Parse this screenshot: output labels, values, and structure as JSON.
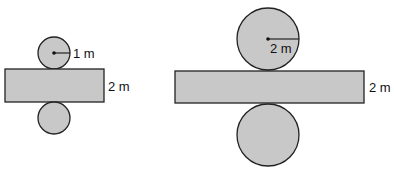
{
  "diagrams": [
    {
      "name": "small-cylinder-net",
      "radius_label": "1 m",
      "height_label": "2 m",
      "top_circle": {
        "cx": 54,
        "cy": 53,
        "r": 16
      },
      "rect": {
        "x": 5,
        "y": 69,
        "w": 99,
        "h": 33
      },
      "bottom_circle": {
        "cx": 54,
        "cy": 118,
        "r": 16
      },
      "radius_label_pos": {
        "x": 73,
        "y": 58
      },
      "height_label_pos": {
        "x": 108,
        "y": 91
      }
    },
    {
      "name": "large-cylinder-net",
      "radius_label": "2 m",
      "height_label": "2 m",
      "top_circle": {
        "cx": 268,
        "cy": 39,
        "r": 31
      },
      "rect": {
        "x": 175,
        "y": 71,
        "w": 189,
        "h": 32
      },
      "bottom_circle": {
        "cx": 268,
        "cy": 135,
        "r": 31
      },
      "radius_label_pos": {
        "x": 268,
        "y": 53
      },
      "height_label_pos": {
        "x": 369,
        "y": 92
      }
    }
  ],
  "colors": {
    "fill": "#c8c8c8",
    "stroke": "#222222",
    "text": "#111111"
  }
}
